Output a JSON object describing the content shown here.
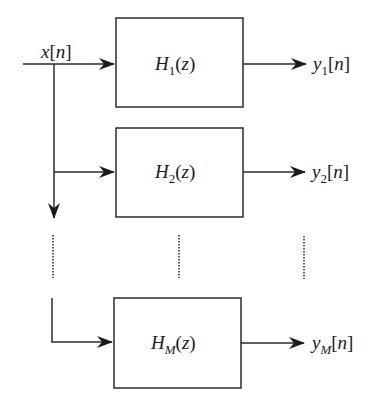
{
  "diagram": {
    "type": "filter-bank",
    "input": {
      "var": "x",
      "index": "n",
      "label": "x[n]"
    },
    "filters": [
      {
        "name": "H",
        "sub": "1",
        "arg": "z",
        "label": "H1(z)",
        "output": {
          "var": "y",
          "sub": "1",
          "index": "n",
          "label": "y1[n]"
        }
      },
      {
        "name": "H",
        "sub": "2",
        "arg": "z",
        "label": "H2(z)",
        "output": {
          "var": "y",
          "sub": "2",
          "index": "n",
          "label": "y2[n]"
        }
      },
      {
        "name": "H",
        "sub": "M",
        "arg": "z",
        "label": "HM(z)",
        "output": {
          "var": "y",
          "sub": "M",
          "index": "n",
          "label": "yM[n]"
        }
      }
    ],
    "ellipsis": "vertical dotted lines indicating filters 3..M-1",
    "colors": {
      "stroke": "#2b2b2b",
      "text": "#1a1a1a",
      "background": "#ffffff"
    }
  }
}
